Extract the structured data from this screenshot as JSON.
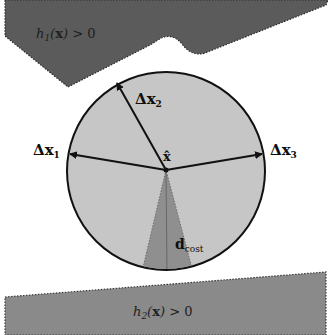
{
  "diagram": {
    "type": "geometric-constraint-illustration",
    "colors": {
      "background": "#ffffff",
      "top_region": "#5b5b5b",
      "bottom_region": "#8a8a8a",
      "circle_fill": "#c6c6c6",
      "cone_fill": "#8f8f8f",
      "stroke": "#111111"
    },
    "regions": {
      "top": {
        "label_func": "h",
        "label_sub": "1",
        "label_arg": "x",
        "label_rel": "> 0"
      },
      "bottom": {
        "label_func": "h",
        "label_sub": "2",
        "label_arg": "x",
        "label_rel": "> 0"
      }
    },
    "center": {
      "label": "x̂",
      "x": 166,
      "y": 170
    },
    "circle": {
      "cx": 166,
      "cy": 171,
      "r": 99
    },
    "vectors": [
      {
        "id": "dx1",
        "label_main": "Δx",
        "label_sub": "1"
      },
      {
        "id": "dx2",
        "label_main": "Δx",
        "label_sub": "2"
      },
      {
        "id": "dx3",
        "label_main": "Δx",
        "label_sub": "3"
      }
    ],
    "cone": {
      "label_main": "d",
      "label_sub": "cost"
    }
  }
}
